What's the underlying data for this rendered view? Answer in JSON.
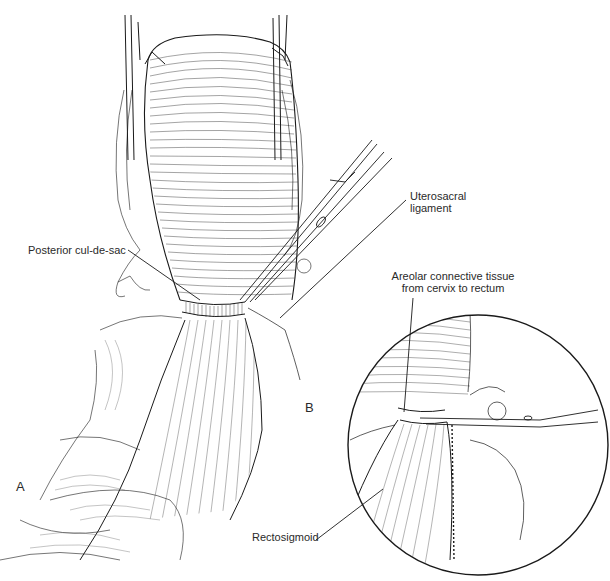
{
  "figure": {
    "panels": [
      {
        "id": "A",
        "letter": "A"
      },
      {
        "id": "B",
        "letter": "B"
      }
    ],
    "labels": {
      "posterior_cul_de_sac": "Posterior cul-de-sac",
      "uterosacral_line1": "Uterosacral",
      "uterosacral_line2": "ligament",
      "areolar_line1": "Areolar connective tissue",
      "areolar_line2": "from cervix to rectum",
      "rectosigmoid": "Rectosigmoid"
    },
    "colors": {
      "ink": "#1a1a1a",
      "background": "#ffffff"
    }
  }
}
